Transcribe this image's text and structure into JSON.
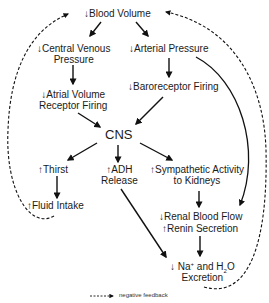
{
  "nodes": {
    "blood_volume": {
      "arrow": "↓",
      "text": "Blood Volume"
    },
    "cvp_line1": {
      "arrow": "↓",
      "text": "Central Venous"
    },
    "cvp_line2": "Pressure",
    "arterial_pressure": {
      "arrow": "↓",
      "text": "Arterial Pressure"
    },
    "atrial_line1": {
      "arrow": "↓",
      "text": "Atrial Volume"
    },
    "atrial_line2": "Receptor Firing",
    "baroreceptor": {
      "arrow": "↓",
      "text": "Baroreceptor Firing"
    },
    "cns": "CNS",
    "thirst": {
      "arrow": "↑",
      "text": "Thirst"
    },
    "adh_line1": {
      "arrow": "↑",
      "text": "ADH"
    },
    "adh_line2": "Release",
    "sympathetic_line1": {
      "arrow": "↑",
      "text": "Sympathetic Activity"
    },
    "sympathetic_line2": "to Kidneys",
    "fluid_intake": {
      "arrow": "↑",
      "text": "Fluid Intake"
    },
    "renal_blood_flow": {
      "arrow": "↓",
      "text": "Renal Blood Flow"
    },
    "renin_secretion": {
      "arrow": "↑",
      "text": "Renin Secretion"
    },
    "excretion_line1": {
      "arrow": "↓",
      "na": "Na",
      "na_sup": "+",
      "and": " and H",
      "h2o_sub": "2",
      "o": "O"
    },
    "excretion_line2": "Excretion"
  },
  "legend": {
    "label": "negative feedback"
  }
}
